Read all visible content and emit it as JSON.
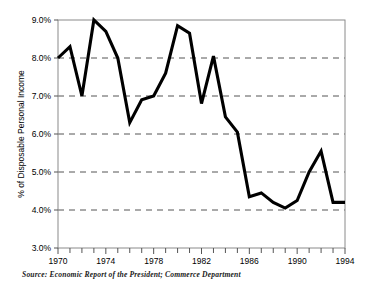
{
  "chart_data": {
    "type": "line",
    "title": "",
    "subtitle": "",
    "xlabel": "",
    "ylabel": "% of Disposable Personal Income",
    "xlim": [
      1970,
      1994
    ],
    "ylim": [
      3.0,
      9.0
    ],
    "grid": true,
    "grid_axis": "y",
    "grid_style": "dashed",
    "legend": "none",
    "y_tick_labels": [
      "9.0%",
      "8.0%",
      "7.0%",
      "6.0%",
      "5.0%",
      "4.0%",
      "3.0%"
    ],
    "y_tick_values": [
      9.0,
      8.0,
      7.0,
      6.0,
      5.0,
      4.0,
      3.0
    ],
    "x_tick_labels": [
      "1970",
      "1974",
      "1978",
      "1982",
      "1986",
      "1990",
      "1994"
    ],
    "x_tick_values": [
      1970,
      1974,
      1978,
      1982,
      1986,
      1990,
      1994
    ],
    "x_minor_ticks": [
      1970,
      1971,
      1972,
      1973,
      1974,
      1975,
      1976,
      1977,
      1978,
      1979,
      1980,
      1981,
      1982,
      1983,
      1984,
      1985,
      1986,
      1987,
      1988,
      1989,
      1990,
      1991,
      1992,
      1993,
      1994
    ],
    "series": [
      {
        "name": "Personal Saving Rate",
        "color": "#000000",
        "x": [
          1970,
          1971,
          1972,
          1973,
          1974,
          1975,
          1976,
          1977,
          1978,
          1979,
          1980,
          1981,
          1982,
          1983,
          1984,
          1985,
          1986,
          1987,
          1988,
          1989,
          1990,
          1991,
          1992,
          1993,
          1994
        ],
        "values": [
          8.0,
          8.3,
          7.0,
          9.0,
          8.7,
          8.0,
          6.3,
          6.9,
          7.0,
          7.6,
          8.85,
          8.65,
          6.8,
          8.05,
          6.45,
          6.05,
          4.35,
          4.45,
          4.2,
          4.05,
          4.25,
          5.0,
          5.55,
          4.2,
          4.2
        ]
      }
    ]
  },
  "source": {
    "label": "Source:",
    "text": "Economic Report of the President; Commerce Department"
  }
}
